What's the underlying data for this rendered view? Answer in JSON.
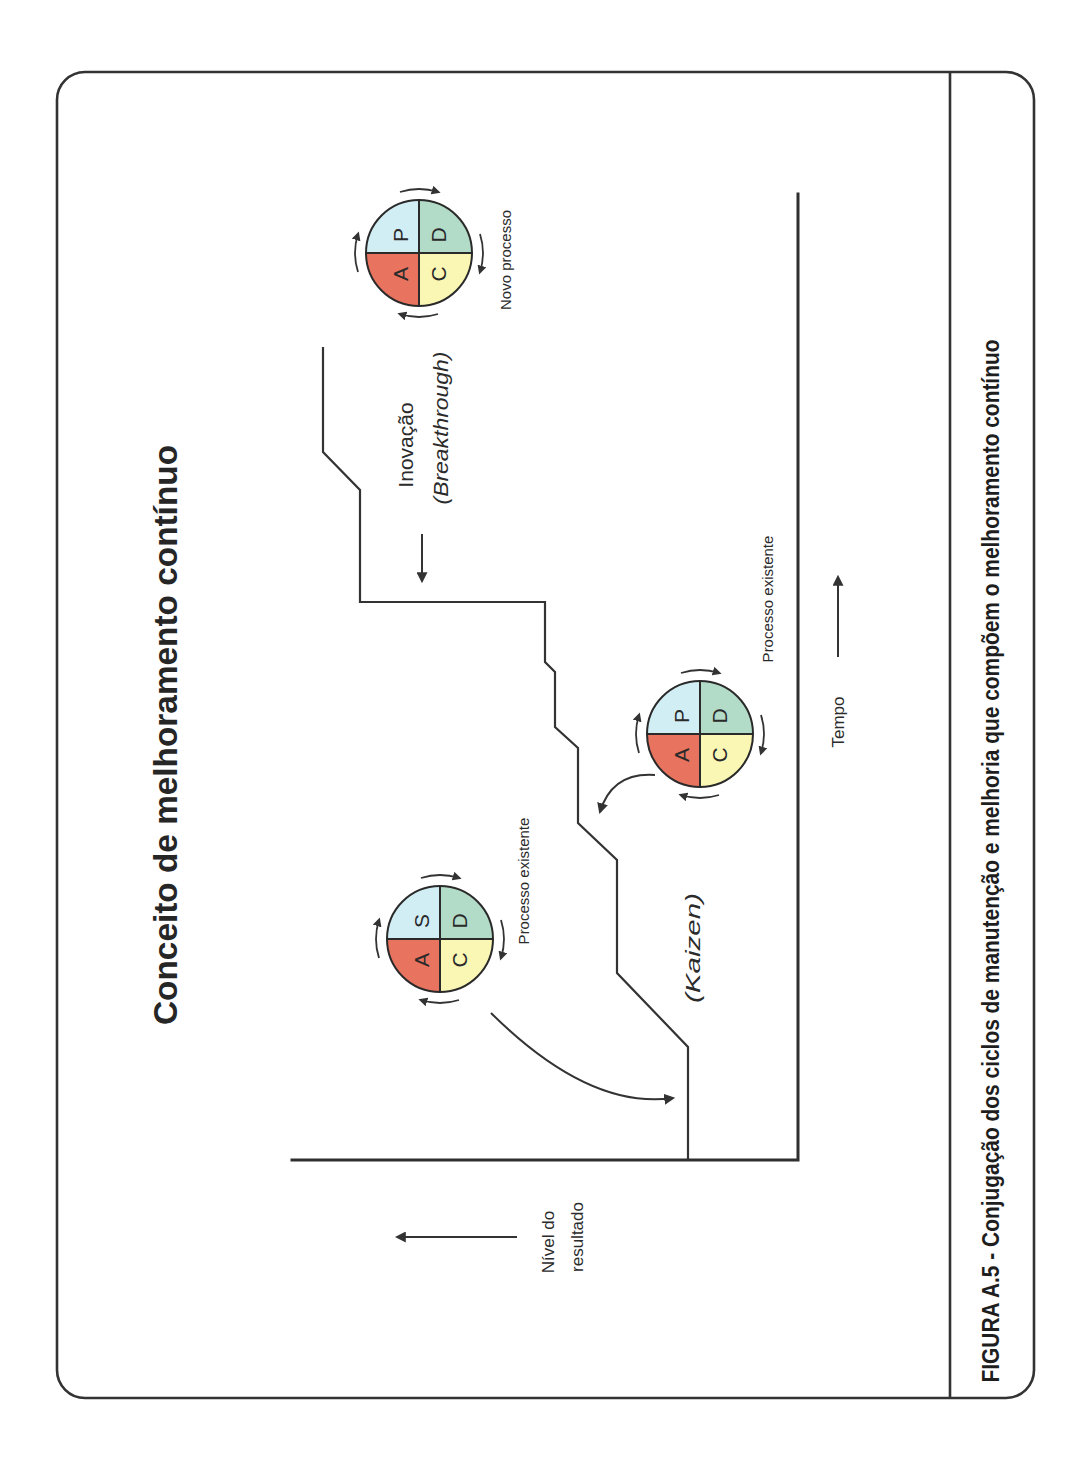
{
  "figure": {
    "title": "Conceito de melhoramento contínuo",
    "caption": "FIGURA A.5 - Conjugação dos ciclos de manutenção e melhoria que compõem o melhoramento contínuo"
  },
  "axes": {
    "y_label_line1": "Nível do",
    "y_label_line2": "resultado",
    "x_label": "Tempo"
  },
  "annotations": {
    "innovation": "Inovação",
    "breakthrough": "(Breakthrough)",
    "kaizen": "(Kaizen)"
  },
  "colors": {
    "plan_standard": "#d2eef5",
    "do": "#b2dcc8",
    "check": "#faf6b3",
    "act": "#e8735f"
  },
  "cycles": [
    {
      "label": "Processo existente",
      "quadrants": {
        "top_left": "S",
        "top_right": "D",
        "bottom_right": "C",
        "bottom_left": "A"
      }
    },
    {
      "label": "Processo existente",
      "quadrants": {
        "top_left": "P",
        "top_right": "D",
        "bottom_right": "C",
        "bottom_left": "A"
      }
    },
    {
      "label": "Novo processo",
      "quadrants": {
        "top_left": "P",
        "top_right": "D",
        "bottom_right": "C",
        "bottom_left": "A"
      }
    }
  ]
}
